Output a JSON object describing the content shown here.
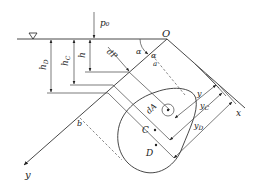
{
  "figure": {
    "labels": {
      "p0": "p₀",
      "O": "O",
      "alpha1": "α",
      "alpha2": "α",
      "a": "a",
      "b": "b",
      "dP": "dP",
      "h": "h",
      "hC": "h",
      "hC_sub": "C",
      "hD": "h",
      "hD_sub": "D",
      "dA": "dA",
      "C": "C",
      "D": "D",
      "y": "y",
      "yC": "y",
      "yC_sub": "C",
      "yD": "y",
      "yD_sub": "D",
      "x_axis": "x",
      "y_axis": "y"
    },
    "icons": {
      "free_surface": "inverted-triangle-water-level"
    },
    "colors": {
      "line": "#333333",
      "background": "#ffffff"
    }
  }
}
